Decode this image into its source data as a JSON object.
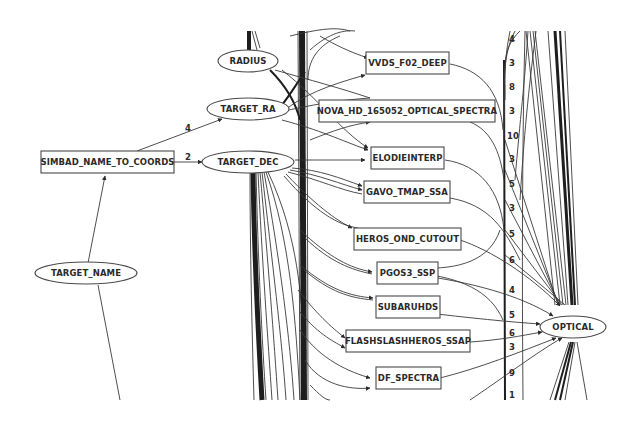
{
  "diagram": {
    "type": "directed-graph",
    "nodes": [
      {
        "id": "radius",
        "label": "RADIUS",
        "shape": "ellipse"
      },
      {
        "id": "target_ra",
        "label": "TARGET_RA",
        "shape": "ellipse"
      },
      {
        "id": "target_dec",
        "label": "TARGET_DEC",
        "shape": "ellipse"
      },
      {
        "id": "simbad",
        "label": "SIMBAD_NAME_TO_COORDS",
        "shape": "box"
      },
      {
        "id": "target_name",
        "label": "TARGET_NAME",
        "shape": "ellipse"
      },
      {
        "id": "vvds",
        "label": "VVDS_F02_DEEP",
        "shape": "box"
      },
      {
        "id": "nova",
        "label": "NOVA_HD_165052_OPTICAL_SPECTRA",
        "shape": "box"
      },
      {
        "id": "elodie",
        "label": "ELODIEINTERP",
        "shape": "box"
      },
      {
        "id": "gavo",
        "label": "GAVO_TMAP_SSA",
        "shape": "box"
      },
      {
        "id": "heros",
        "label": "HEROS_OND_CUTOUT",
        "shape": "box"
      },
      {
        "id": "pgos3",
        "label": "PGOS3_SSP",
        "shape": "box"
      },
      {
        "id": "subaru",
        "label": "SUBARUHDS",
        "shape": "box"
      },
      {
        "id": "flash",
        "label": "FLASHSLASHHEROS_SSAP",
        "shape": "box"
      },
      {
        "id": "df",
        "label": "DF_SPECTRA",
        "shape": "box"
      },
      {
        "id": "optical",
        "label": "OPTICAL",
        "shape": "ellipse"
      }
    ],
    "edges": [
      {
        "from": "target_name",
        "to": "simbad",
        "label": ""
      },
      {
        "from": "simbad",
        "to": "target_ra",
        "label": "4"
      },
      {
        "from": "simbad",
        "to": "target_dec",
        "label": "2"
      },
      {
        "from": "vvds",
        "to": "optical",
        "label": ""
      },
      {
        "from": "nova",
        "to": "optical",
        "label": ""
      },
      {
        "from": "elodie",
        "to": "optical",
        "label": ""
      },
      {
        "from": "gavo",
        "to": "optical",
        "label": ""
      },
      {
        "from": "heros",
        "to": "optical",
        "label": ""
      },
      {
        "from": "pgos3",
        "to": "optical",
        "label": "4"
      },
      {
        "from": "subaru",
        "to": "optical",
        "label": "5"
      },
      {
        "from": "flash",
        "to": "optical",
        "label": "6"
      },
      {
        "from": "df",
        "to": "optical",
        "label": "3"
      }
    ],
    "column_labels": [
      "4",
      "3",
      "8",
      "3",
      "10",
      "3",
      "5",
      "3",
      "5",
      "6",
      "4",
      "5",
      "6",
      "3",
      "9",
      "1"
    ]
  }
}
